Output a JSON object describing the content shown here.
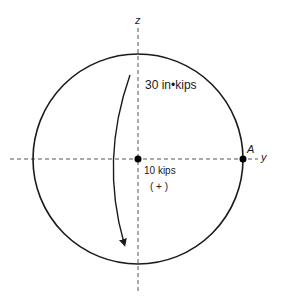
{
  "diagram": {
    "axes": {
      "z_label": "z",
      "y_label": "y"
    },
    "point_label": "A",
    "moment_label": "30 in•kips",
    "force_label": "10 kips",
    "force_sign": "( + )",
    "colors": {
      "stroke": "#1a1a1a",
      "axis": "#555555",
      "background": "#ffffff"
    }
  }
}
